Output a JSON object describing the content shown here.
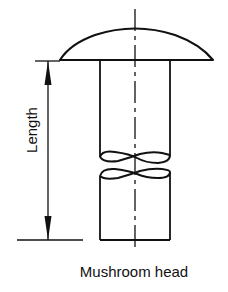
{
  "diagram": {
    "caption": "Mushroom head",
    "dimension_label": "Length",
    "colors": {
      "stroke": "#111111",
      "background": "#ffffff"
    },
    "parts": [
      "mushroom-head",
      "shank",
      "break-lines",
      "centerline",
      "length-dimension"
    ]
  }
}
